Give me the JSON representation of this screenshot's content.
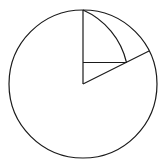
{
  "diagram": {
    "type": "geometry",
    "stroke_color": "#1a1a1a",
    "background": "#ffffff",
    "circle": {
      "cx": 83,
      "cy": 84,
      "r": 74
    },
    "points": {
      "top": [
        83,
        10
      ],
      "center": [
        83,
        84
      ],
      "rim": [
        149,
        51
      ],
      "inner": [
        126.5,
        62.5
      ],
      "foot": [
        83,
        62.5
      ]
    },
    "segments": [
      {
        "name": "vertical-radius",
        "from": "center",
        "to": "top"
      },
      {
        "name": "oblique-radius",
        "from": "center",
        "to": "rim"
      },
      {
        "name": "horizontal-segment",
        "from": "foot",
        "to": "inner"
      }
    ],
    "arcs": [
      {
        "name": "inner-arc",
        "from": "top",
        "to": "inner",
        "r": 76
      }
    ],
    "labels": []
  }
}
